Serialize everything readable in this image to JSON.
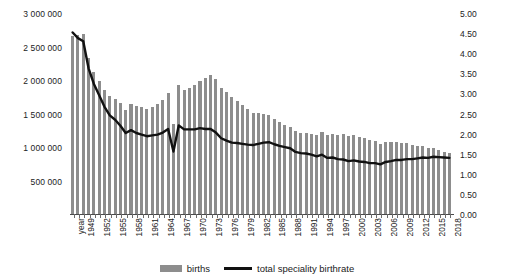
{
  "chart_data": {
    "type": "bar",
    "title": "",
    "xlabel": "year",
    "ylabel": "",
    "grid": false,
    "legend_position": "bottom",
    "x_axis": {
      "first_label": "year",
      "tick_labels": [
        "year",
        "1949",
        "1952",
        "1955",
        "1958",
        "1961",
        "1964",
        "1967",
        "1970",
        "1973",
        "1976",
        "1979",
        "1982",
        "1985",
        "1988",
        "1991",
        "1994",
        "1997",
        "2000",
        "2003",
        "2006",
        "2009",
        "2012",
        "2015",
        "2018"
      ],
      "tick_step_years": 3,
      "start_year": 1947,
      "end_year": 2018
    },
    "left_axis": {
      "label": "births",
      "ticks": [
        "0",
        "500 000",
        "1 000 000",
        "1 500 000",
        "2 000 000",
        "2 500 000",
        "3 000 000"
      ],
      "tick_values": [
        0,
        500000,
        1000000,
        1500000,
        2000000,
        2500000,
        3000000
      ],
      "min": 0,
      "max": 3000000
    },
    "right_axis": {
      "label": "total speciality birthrate",
      "ticks": [
        "0.00",
        "0.50",
        "1.00",
        "1.50",
        "2.00",
        "2.50",
        "3.00",
        "3.50",
        "4.00",
        "4.50",
        "5.00"
      ],
      "tick_values": [
        0,
        0.5,
        1.0,
        1.5,
        2.0,
        2.5,
        3.0,
        3.5,
        4.0,
        4.5,
        5.0
      ],
      "min": 0,
      "max": 5.0
    },
    "years": [
      1947,
      1948,
      1949,
      1950,
      1951,
      1952,
      1953,
      1954,
      1955,
      1956,
      1957,
      1958,
      1959,
      1960,
      1961,
      1962,
      1963,
      1964,
      1965,
      1966,
      1967,
      1968,
      1969,
      1970,
      1971,
      1972,
      1973,
      1974,
      1975,
      1976,
      1977,
      1978,
      1979,
      1980,
      1981,
      1982,
      1983,
      1984,
      1985,
      1986,
      1987,
      1988,
      1989,
      1990,
      1991,
      1992,
      1993,
      1994,
      1995,
      1996,
      1997,
      1998,
      1999,
      2000,
      2001,
      2002,
      2003,
      2004,
      2005,
      2006,
      2007,
      2008,
      2009,
      2010,
      2011,
      2012,
      2013,
      2014,
      2015,
      2016,
      2017,
      2018
    ],
    "series": [
      {
        "name": "births",
        "type": "bar",
        "axis": "left",
        "color": "#8d8d8d",
        "values": [
          2678792,
          2681624,
          2696638,
          2337507,
          2137689,
          2005162,
          1868040,
          1769580,
          1730692,
          1665278,
          1566713,
          1653469,
          1626088,
          1606041,
          1589372,
          1618616,
          1659521,
          1716761,
          1823697,
          1360974,
          1935647,
          1871839,
          1889815,
          1934239,
          2000973,
          2038682,
          2091983,
          2029989,
          1901440,
          1832617,
          1755100,
          1708643,
          1642580,
          1576889,
          1529455,
          1515392,
          1508687,
          1489780,
          1431577,
          1382946,
          1346658,
          1314006,
          1246802,
          1221585,
          1223245,
          1208989,
          1188282,
          1238328,
          1187064,
          1206555,
          1191665,
          1203147,
          1177669,
          1190547,
          1170662,
          1153855,
          1123610,
          1110721,
          1062530,
          1092674,
          1089818,
          1091156,
          1070035,
          1071304,
          1050806,
          1037231,
          1029816,
          1003539,
          1005677,
          976978,
          946065,
          918397
        ]
      },
      {
        "name": "total speciality birthrate",
        "type": "line",
        "axis": "right",
        "color": "#111111",
        "values": [
          4.54,
          4.4,
          4.32,
          3.65,
          3.26,
          2.98,
          2.69,
          2.48,
          2.37,
          2.22,
          2.04,
          2.11,
          2.04,
          2.0,
          1.96,
          1.98,
          2.0,
          2.05,
          2.14,
          1.58,
          2.23,
          2.13,
          2.13,
          2.13,
          2.16,
          2.14,
          2.14,
          2.05,
          1.91,
          1.85,
          1.8,
          1.79,
          1.77,
          1.75,
          1.74,
          1.77,
          1.8,
          1.81,
          1.76,
          1.72,
          1.69,
          1.66,
          1.57,
          1.54,
          1.53,
          1.5,
          1.46,
          1.5,
          1.42,
          1.43,
          1.39,
          1.38,
          1.34,
          1.36,
          1.33,
          1.32,
          1.29,
          1.29,
          1.26,
          1.32,
          1.34,
          1.37,
          1.37,
          1.39,
          1.39,
          1.41,
          1.43,
          1.42,
          1.45,
          1.44,
          1.43,
          1.42
        ]
      }
    ]
  },
  "legend": {
    "items": [
      {
        "label": "births",
        "marker": "bar-swatch",
        "color": "#8d8d8d"
      },
      {
        "label": "total speciality birthrate",
        "marker": "line-swatch",
        "color": "#111111"
      }
    ]
  },
  "colors": {
    "bar": "#8d8d8d",
    "line": "#111111",
    "axis": "#4a4a4a",
    "text": "#1a1a1a",
    "background": "#ffffff"
  }
}
